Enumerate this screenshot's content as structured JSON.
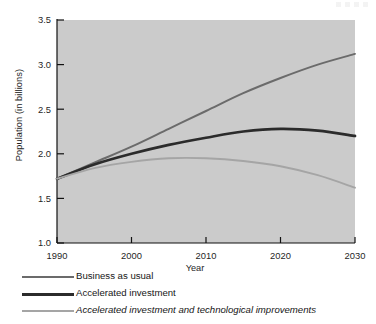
{
  "figure": {
    "name": "population-projection-chart",
    "axis_label_x": "Year",
    "axis_label_y": "Population (in billions)"
  },
  "legend": {
    "items": [
      {
        "label": "Business as usual",
        "color": "#6b6b6b",
        "thickness": "2.2",
        "italic": false
      },
      {
        "label": "Accelerated investment",
        "color": "#2b2b2b",
        "thickness": "3.0",
        "italic": false
      },
      {
        "label": "Accelerated investment and technological improvements",
        "color": "#a5a5a5",
        "thickness": "2.2",
        "italic": true
      }
    ]
  },
  "chart_data": {
    "type": "line",
    "title": "",
    "xlabel": "Year",
    "ylabel": "Population (in billions)",
    "xlim": [
      1990,
      2030
    ],
    "ylim": [
      1.0,
      3.5
    ],
    "xticks": [
      1990,
      2000,
      2010,
      2020,
      2030
    ],
    "xtick_labels": [
      "1990",
      "2000",
      "2010",
      "2020",
      "2030"
    ],
    "yticks": [
      1.0,
      1.5,
      2.0,
      2.5,
      3.0,
      3.5
    ],
    "ytick_labels": [
      "1.0",
      "1.5",
      "2.0",
      "2.5",
      "3.0",
      "3.5"
    ],
    "grid": false,
    "plot_background": "#c9c9c9",
    "legend_position": "below-axes",
    "x": [
      1990,
      1995,
      2000,
      2005,
      2010,
      2015,
      2020,
      2025,
      2030
    ],
    "series": [
      {
        "name": "Business as usual",
        "color": "#6b6b6b",
        "values": [
          1.72,
          1.9,
          2.08,
          2.28,
          2.48,
          2.68,
          2.85,
          3.0,
          3.12
        ]
      },
      {
        "name": "Accelerated investment",
        "color": "#2b2b2b",
        "values": [
          1.72,
          1.88,
          2.0,
          2.1,
          2.18,
          2.25,
          2.28,
          2.26,
          2.2
        ]
      },
      {
        "name": "Accelerated investment and technological improvements",
        "color": "#a5a5a5",
        "values": [
          1.72,
          1.84,
          1.91,
          1.95,
          1.95,
          1.92,
          1.86,
          1.76,
          1.62
        ]
      }
    ]
  }
}
